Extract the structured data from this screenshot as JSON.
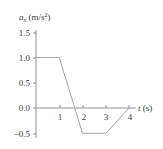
{
  "chart_data": {
    "type": "line",
    "title": "",
    "xlabel": "t (s)",
    "ylabel": "a_x (m/s^2)",
    "ylabel_parts": {
      "symbol": "a",
      "subscript": "x",
      "unit_open": " (m/s",
      "sup": "2",
      "unit_close": ")"
    },
    "xlabel_parts": {
      "symbol": "t",
      "unit": " (s)"
    },
    "x": [
      0,
      1,
      2,
      3,
      4
    ],
    "series": [
      {
        "name": "a_x",
        "values": [
          1.0,
          1.0,
          -0.5,
          -0.5,
          0.0
        ]
      }
    ],
    "xlim": [
      0,
      4
    ],
    "ylim": [
      -0.5,
      1.5
    ],
    "xticks": [
      "1",
      "2",
      "3",
      "4"
    ],
    "yticks": [
      "1.5",
      "1.0",
      "0.5",
      "0.0",
      "−0.5"
    ],
    "grid": false,
    "legend": null,
    "line_color": "#a6a6a6",
    "axis_color": "#7a7a7a"
  }
}
